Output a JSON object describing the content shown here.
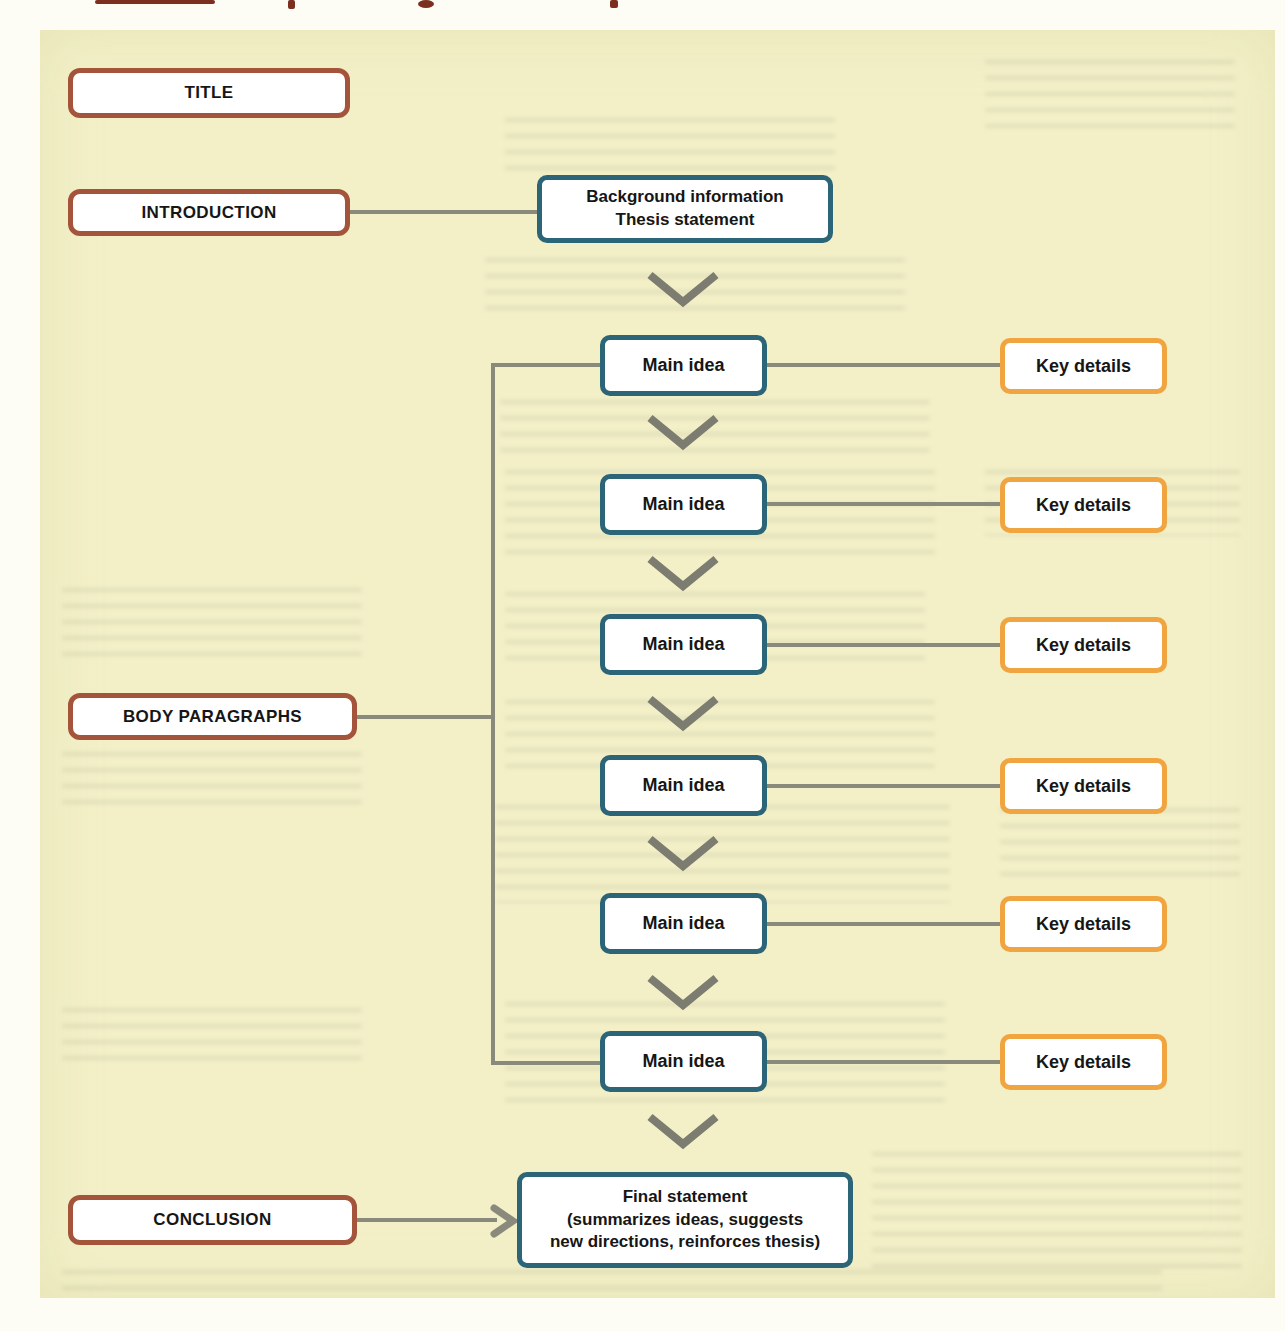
{
  "figure": {
    "outline": {
      "title": "TITLE",
      "introduction": "INTRODUCTION",
      "body_paragraphs": "BODY PARAGRAPHS",
      "conclusion": "CONCLUSION"
    },
    "intro_box": {
      "line1": "Background information",
      "line2": "Thesis statement"
    },
    "rows": [
      {
        "main": "Main idea",
        "key": "Key details"
      },
      {
        "main": "Main idea",
        "key": "Key details"
      },
      {
        "main": "Main idea",
        "key": "Key details"
      },
      {
        "main": "Main idea",
        "key": "Key details"
      },
      {
        "main": "Main idea",
        "key": "Key details"
      },
      {
        "main": "Main idea",
        "key": "Key details"
      }
    ],
    "final_box": {
      "line1": "Final statement",
      "line2": "(summarizes ideas, suggests",
      "line3": "new directions, reinforces thesis)"
    },
    "colors": {
      "panel_background": "#f3f0c8",
      "heading_box_border": "#a3543a",
      "idea_box_border": "#2d6578",
      "details_box_border": "#f0a541",
      "connector_line": "#8a8a7c",
      "chevron": "#7c7c70"
    }
  }
}
